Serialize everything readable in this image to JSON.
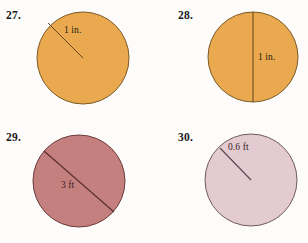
{
  "page": {
    "kind": "math-worksheet-figures",
    "background_color": "#fdfcfa"
  },
  "problems": [
    {
      "number": "27.",
      "number_pos": {
        "x": 6,
        "y": 9
      },
      "shape": "circle",
      "fill_color": "#eaa94e",
      "stroke_color": "#7a5a2a",
      "circle": {
        "cx": 83,
        "cy": 58,
        "r": 46
      },
      "segment": {
        "type": "radius",
        "x1": 48,
        "y1": 23,
        "x2": 83,
        "y2": 58,
        "color": "#5d4420"
      },
      "label": {
        "text": "1 in.",
        "x": 64,
        "y": 25
      }
    },
    {
      "number": "28.",
      "number_pos": {
        "x": 178,
        "y": 9
      },
      "shape": "circle",
      "fill_color": "#eaa94e",
      "stroke_color": "#7a5a2a",
      "circle": {
        "cx": 253,
        "cy": 57,
        "r": 45
      },
      "segment": {
        "type": "diameter",
        "x1": 253,
        "y1": 12,
        "x2": 253,
        "y2": 102,
        "color": "#5d4420"
      },
      "label": {
        "text": "1 in.",
        "x": 258,
        "y": 52
      }
    },
    {
      "number": "29.",
      "number_pos": {
        "x": 6,
        "y": 131
      },
      "shape": "circle",
      "fill_color": "#c4807f",
      "stroke_color": "#6b3b3a",
      "circle": {
        "cx": 79,
        "cy": 181,
        "r": 46
      },
      "segment": {
        "type": "diameter",
        "x1": 44,
        "y1": 151,
        "x2": 114,
        "y2": 212,
        "color": "#5a2f2e"
      },
      "label": {
        "text": "3 ft",
        "x": 61,
        "y": 180
      }
    },
    {
      "number": "30.",
      "number_pos": {
        "x": 178,
        "y": 131
      },
      "shape": "circle",
      "fill_color": "#e3cbd1",
      "stroke_color": "#6e5b60",
      "circle": {
        "cx": 251,
        "cy": 180,
        "r": 46
      },
      "segment": {
        "type": "radius",
        "x1": 220,
        "y1": 148,
        "x2": 251,
        "y2": 180,
        "color": "#5b4a50"
      },
      "label": {
        "text": "0.6 ft",
        "x": 228,
        "y": 142
      }
    }
  ]
}
